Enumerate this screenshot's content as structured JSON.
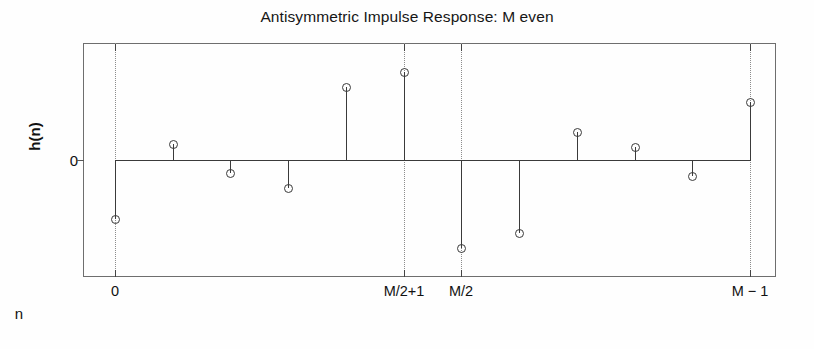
{
  "figure": {
    "width": 814,
    "height": 349,
    "background": "#fefefe",
    "line_color": "#3a3a3a",
    "grid_color": "#8c8c8c",
    "axis_color": "#6e6e6e"
  },
  "chart_data": {
    "type": "scatter",
    "plot_style": "stem",
    "title": "Antisymmetric Impulse Response: M even",
    "xlabel": "n",
    "ylabel": "h(n)",
    "grid": "vertical dotted gridlines at labeled x ticks only",
    "legend": null,
    "x": [
      0,
      1,
      2,
      3,
      4,
      5,
      6,
      7,
      8,
      9,
      10,
      11
    ],
    "values": [
      -0.54,
      0.145,
      -0.12,
      -0.26,
      0.67,
      0.81,
      -0.81,
      -0.67,
      0.26,
      0.12,
      -0.145,
      0.54
    ],
    "baseline": 0,
    "ylim": [
      -1.08,
      1.08
    ],
    "xlim": [
      -0.55,
      11.45
    ],
    "y_ticks": [
      0
    ],
    "y_tick_labels": [
      "0"
    ],
    "x_ticks": [
      0,
      5,
      6,
      11
    ],
    "x_tick_labels": [
      "0",
      "M/2+1",
      "M/2",
      "M − 1"
    ],
    "gridline_x": [
      0,
      5,
      6,
      11
    ],
    "annotation": "Antisymmetric sequence: h(n) = -h(M-1-n); M even, so no zero-valued center sample."
  },
  "marker": {
    "shape": "circle-open",
    "size_px": 9
  }
}
